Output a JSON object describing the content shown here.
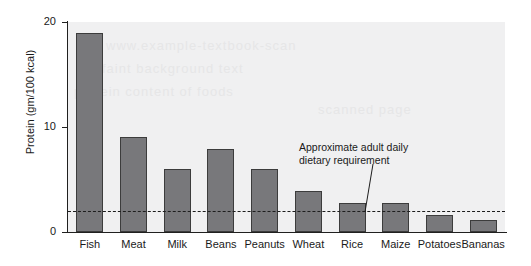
{
  "chart_data": {
    "type": "bar",
    "title": "",
    "subtitle": "",
    "xlabel": "",
    "ylabel": "Protein (gm/100 kcal)",
    "ylim": [
      0,
      20
    ],
    "yticks": [
      0,
      10,
      20
    ],
    "ytick_labels": [
      "0",
      "10",
      "20"
    ],
    "grid": false,
    "legend": "none",
    "categories": [
      "Fish",
      "Meat",
      "Milk",
      "Beans",
      "Peanuts",
      "Wheat",
      "Rice",
      "Maize",
      "Potatoes",
      "Bananas"
    ],
    "values": [
      19.0,
      9.1,
      6.0,
      7.9,
      6.0,
      3.9,
      2.8,
      2.8,
      1.6,
      1.1
    ],
    "bar_color": "#78787b",
    "bar_edge_color": "#3c3c3c",
    "plot_background": "#f0f0f1",
    "reference_line": {
      "value": 2.0,
      "style": "dashed",
      "color": "#1d1d1d",
      "annotation_line_1": "Approximate adult daily",
      "annotation_line_2": "dietary requirement"
    },
    "annotations": [
      {
        "text": "Approximate adult daily dietary requirement",
        "points_to": "reference_line"
      }
    ]
  },
  "watermark": {
    "line_1": "www.example-textbook-scan",
    "line_2": "faint background text",
    "line_3": "protein content of foods",
    "line_4": "scanned page"
  },
  "axis": {
    "tick_0": "0",
    "tick_10": "10",
    "tick_20": "20",
    "y_title": "Protein (gm/100 kcal)"
  },
  "labels": {
    "fish": "Fish",
    "meat": "Meat",
    "milk": "Milk",
    "beans": "Beans",
    "peanuts": "Peanuts",
    "wheat": "Wheat",
    "rice": "Rice",
    "maize": "Maize",
    "potatoes": "Potatoes",
    "bananas": "Bananas"
  },
  "annotation": {
    "line_1": "Approximate adult daily",
    "line_2": "dietary requirement"
  }
}
